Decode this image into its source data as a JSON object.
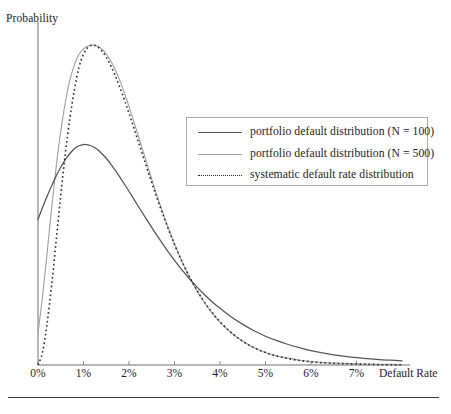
{
  "axes": {
    "ylabel": "Probability",
    "xlabel": "Default Rate",
    "xticks": [
      "0%",
      "1%",
      "2%",
      "3%",
      "4%",
      "5%",
      "6%",
      "7%"
    ]
  },
  "legend": {
    "items": [
      {
        "label": "portfolio default distribution (N = 100)",
        "style": "solid-dark",
        "color": "#555555"
      },
      {
        "label": "portfolio default distribution (N = 500)",
        "style": "solid-light",
        "color": "#9e9e9e"
      },
      {
        "label": "systematic default rate distribution",
        "style": "dotted",
        "color": "#2b2b2b"
      }
    ]
  },
  "chart_data": {
    "type": "line",
    "title": "",
    "subtitle": "",
    "xlabel": "Default Rate",
    "ylabel": "Probability",
    "xlim": [
      0,
      8
    ],
    "ylim": [
      0,
      1.05
    ],
    "xticks": [
      0,
      1,
      2,
      3,
      4,
      5,
      6,
      7
    ],
    "xticklabels": [
      "0%",
      "1%",
      "2%",
      "3%",
      "4%",
      "5%",
      "6%",
      "7%"
    ],
    "yticks": [],
    "grid": false,
    "legend_position": "upper-right-inset",
    "x": [
      0,
      0.1,
      0.2,
      0.3,
      0.4,
      0.5,
      0.6,
      0.7,
      0.8,
      0.9,
      1.0,
      1.1,
      1.2,
      1.3,
      1.4,
      1.5,
      1.6,
      1.7,
      1.8,
      1.9,
      2.0,
      2.2,
      2.4,
      2.6,
      2.8,
      3.0,
      3.2,
      3.4,
      3.6,
      3.8,
      4.0,
      4.25,
      4.5,
      4.75,
      5.0,
      5.25,
      5.5,
      5.75,
      6.0,
      6.25,
      6.5,
      6.75,
      7.0,
      7.25,
      7.5,
      7.75,
      8.0
    ],
    "series": [
      {
        "name": "portfolio default distribution (N = 100)",
        "color": "#555555",
        "style": "solid",
        "values": [
          0.455,
          0.492,
          0.527,
          0.56,
          0.591,
          0.618,
          0.642,
          0.661,
          0.676,
          0.685,
          0.689,
          0.688,
          0.683,
          0.674,
          0.661,
          0.646,
          0.628,
          0.608,
          0.587,
          0.565,
          0.543,
          0.497,
          0.452,
          0.408,
          0.366,
          0.327,
          0.291,
          0.258,
          0.228,
          0.201,
          0.177,
          0.15,
          0.127,
          0.107,
          0.09,
          0.076,
          0.064,
          0.054,
          0.045,
          0.038,
          0.032,
          0.027,
          0.023,
          0.02,
          0.017,
          0.015,
          0.013
        ]
      },
      {
        "name": "portfolio default distribution (N = 500)",
        "color": "#9e9e9e",
        "style": "solid",
        "values": [
          0.1,
          0.215,
          0.35,
          0.49,
          0.62,
          0.73,
          0.82,
          0.89,
          0.938,
          0.97,
          0.988,
          0.997,
          1.0,
          0.997,
          0.988,
          0.972,
          0.95,
          0.922,
          0.888,
          0.85,
          0.808,
          0.718,
          0.626,
          0.536,
          0.453,
          0.378,
          0.312,
          0.255,
          0.207,
          0.167,
          0.134,
          0.1,
          0.074,
          0.054,
          0.039,
          0.028,
          0.021,
          0.015,
          0.011,
          0.008,
          0.006,
          0.005,
          0.004,
          0.003,
          0.002,
          0.002,
          0.001
        ]
      },
      {
        "name": "systematic default rate distribution",
        "color": "#2b2b2b",
        "style": "dotted",
        "values": [
          0.0,
          0.04,
          0.13,
          0.25,
          0.39,
          0.53,
          0.66,
          0.77,
          0.86,
          0.93,
          0.971,
          0.993,
          1.0,
          0.995,
          0.982,
          0.962,
          0.935,
          0.903,
          0.867,
          0.828,
          0.787,
          0.7,
          0.613,
          0.528,
          0.449,
          0.377,
          0.313,
          0.257,
          0.209,
          0.169,
          0.135,
          0.101,
          0.074,
          0.054,
          0.039,
          0.028,
          0.02,
          0.014,
          0.01,
          0.007,
          0.005,
          0.004,
          0.003,
          0.002,
          0.001,
          0.001,
          0.001
        ]
      }
    ]
  },
  "geometry": {
    "origin_x": 38,
    "baseline_y": 365,
    "px_per_pct": 45.5,
    "top_y": 45
  }
}
